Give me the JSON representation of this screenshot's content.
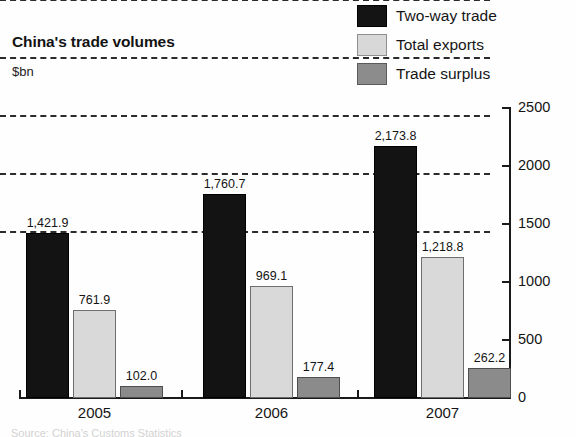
{
  "header": {
    "title": "China's trade volumes",
    "units": "$bn"
  },
  "legend": {
    "position": "top-right",
    "items": [
      {
        "label": "Two-way trade",
        "swatch": "legend-swatch-two-way-trade",
        "color": "#131313"
      },
      {
        "label": "Total exports",
        "swatch": "legend-swatch-total-exports",
        "color": "#d9d9d9"
      },
      {
        "label": "Trade surplus",
        "swatch": "legend-swatch-trade-surplus",
        "color": "#8b8b8b"
      }
    ]
  },
  "axis": {
    "y_ticks": [
      "2500",
      "2000",
      "1500",
      "1000",
      "500",
      "0"
    ],
    "x_ticks": [
      "2005",
      "2006",
      "2007"
    ]
  },
  "value_labels": {
    "g2005": {
      "twoway": "1,421.9",
      "exports": "761.9",
      "surplus": "102.0"
    },
    "g2006": {
      "twoway": "1,760.7",
      "exports": "969.1",
      "surplus": "177.4"
    },
    "g2007": {
      "twoway": "2,173.8",
      "exports": "1,218.8",
      "surplus": "262.2"
    }
  },
  "footer": {
    "source": "Source: China's Customs Statistics"
  },
  "chart_data": {
    "type": "bar",
    "title": "China's trade volumes",
    "subtitle": "$bn",
    "xlabel": "",
    "ylabel": "$bn",
    "categories": [
      "2005",
      "2006",
      "2007"
    ],
    "series": [
      {
        "name": "Two-way trade",
        "values": [
          1421.9,
          1760.7,
          2173.8
        ],
        "color": "#131313"
      },
      {
        "name": "Total exports",
        "values": [
          761.9,
          969.1,
          1218.8
        ],
        "color": "#d9d9d9"
      },
      {
        "name": "Trade surplus",
        "values": [
          102.0,
          177.4,
          262.2
        ],
        "color": "#8b8b8b"
      }
    ],
    "ylim": [
      0,
      2500
    ],
    "yticks": [
      0,
      500,
      1000,
      1500,
      2000,
      2500
    ],
    "grid": "horizontal-dashed",
    "legend_position": "top-right",
    "data_labels": true
  }
}
